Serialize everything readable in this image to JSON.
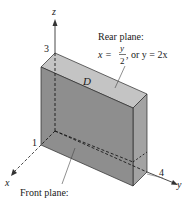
{
  "diagram": {
    "type": "3d-solid-region",
    "axes": {
      "x": {
        "label": "x",
        "tick": "1"
      },
      "y": {
        "label": "y",
        "tick": "4"
      },
      "z": {
        "label": "z",
        "tick": "3"
      }
    },
    "region_label": "D",
    "rear_plane": {
      "title": "Rear plane:",
      "eq_lhs": "x =",
      "eq_num": "y",
      "eq_den": "2",
      "eq_rest": ", or y = 2x"
    },
    "front_plane": {
      "title": "Front plane:"
    },
    "colors": {
      "front_face": "#8c8c8c",
      "top_face": "#c4c4c4",
      "side_face": "#a6a6a6",
      "edge": "#2a2a2a"
    }
  }
}
